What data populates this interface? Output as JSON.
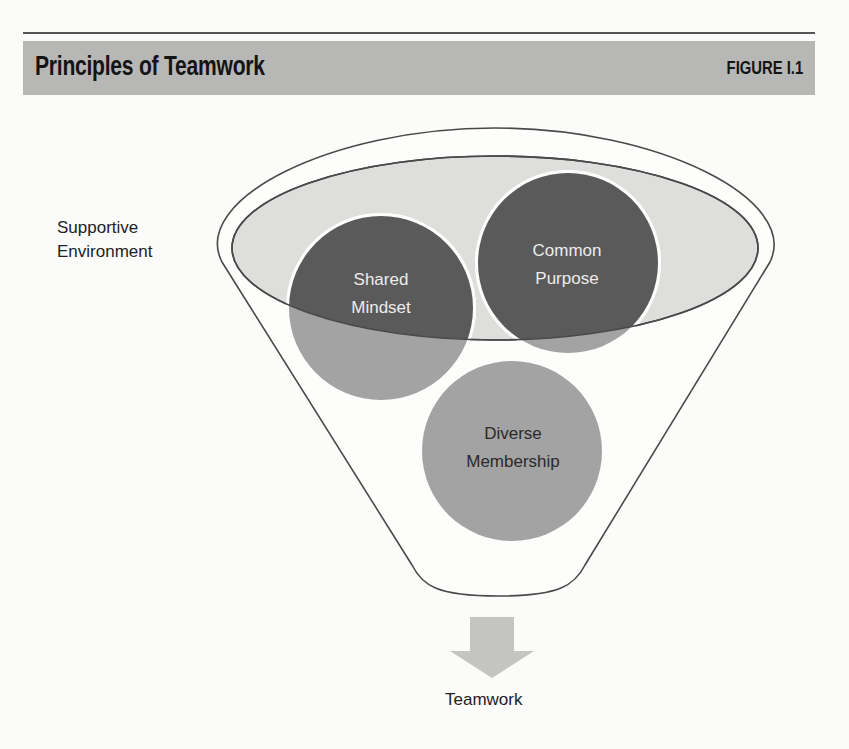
{
  "header": {
    "title": "Principles of Teamwork",
    "figure_label": "FIGURE I.1"
  },
  "diagram": {
    "container": {
      "label_line1": "Supportive",
      "label_line2": "Environment"
    },
    "circles": [
      {
        "line1": "Shared",
        "line2": "Mindset",
        "tone": "dark"
      },
      {
        "line1": "Common",
        "line2": "Purpose",
        "tone": "dark"
      },
      {
        "line1": "Diverse",
        "line2": "Membership",
        "tone": "medium"
      }
    ],
    "output": {
      "label": "Teamwork"
    }
  },
  "colors": {
    "header_bar": "#b7b7b5",
    "dark_circle": "#5a5a5a",
    "medium_circle": "#a3a3a3",
    "environment_fill": "#dededc",
    "arrow": "#c4c4c2",
    "outline": "#4a4a4a"
  }
}
